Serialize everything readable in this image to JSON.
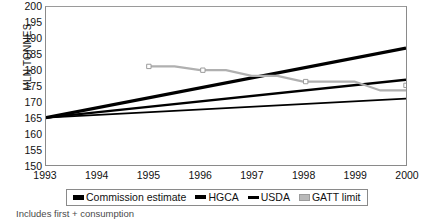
{
  "chart_data": {
    "type": "line",
    "title": "",
    "xlabel": "",
    "ylabel": "MLN TONNES",
    "xlim": [
      1993,
      2000
    ],
    "ylim": [
      150,
      200
    ],
    "ytick_step": 5,
    "grid": false,
    "legend_position": "bottom",
    "x": [
      1993,
      1994,
      1995,
      1996,
      1997,
      1998,
      1999,
      2000
    ],
    "xticklabels": [
      "1993",
      "1994",
      "1995",
      "1996",
      "1997",
      "1998",
      "1999",
      "2000"
    ],
    "yticklabels": [
      "200",
      "195",
      "190",
      "185",
      "180",
      "175",
      "170",
      "165",
      "160",
      "155",
      "150"
    ],
    "yticks": [
      200,
      195,
      190,
      185,
      180,
      175,
      170,
      165,
      160,
      155,
      150
    ],
    "series": [
      {
        "name": "Commission estimate",
        "style": "line",
        "color": "#000000",
        "width": 3.2,
        "x": [
          1993,
          2000
        ],
        "values": [
          165,
          187
        ]
      },
      {
        "name": "HGCA",
        "style": "line",
        "color": "#000000",
        "width": 2.4,
        "x": [
          1993,
          2000
        ],
        "values": [
          165,
          177
        ]
      },
      {
        "name": "USDA",
        "style": "line",
        "color": "#000000",
        "width": 1.8,
        "x": [
          1993,
          2000
        ],
        "values": [
          165,
          171
        ]
      },
      {
        "name": "GATT limit",
        "style": "step",
        "color": "#b0b0b0",
        "width": 2.2,
        "marker": "square",
        "x": [
          1995.0,
          1995.5,
          1996.0,
          1996.5,
          1997.0,
          1997.5,
          1998.0,
          1998.5,
          1999.0,
          1999.5,
          2000.0
        ],
        "values": [
          181.2,
          181.2,
          180.0,
          180.0,
          178.2,
          178.2,
          176.4,
          176.4,
          176.4,
          173.6,
          173.6
        ],
        "marker_points": [
          {
            "x": 1995.0,
            "y": 181.2
          },
          {
            "x": 1996.05,
            "y": 180.0
          },
          {
            "x": 1998.05,
            "y": 176.4
          },
          {
            "x": 2000.0,
            "y": 175.2
          }
        ]
      }
    ],
    "legend": [
      {
        "label": "Commission estimate",
        "swatch": "sw-thick"
      },
      {
        "label": "HGCA",
        "swatch": "sw-med"
      },
      {
        "label": "USDA",
        "swatch": "sw-thin"
      },
      {
        "label": "GATT limit",
        "swatch": "sw-gatt"
      }
    ],
    "footnote": "Includes first + consumption"
  }
}
